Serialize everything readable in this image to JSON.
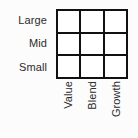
{
  "chart_data": {
    "type": "table",
    "title": "",
    "xlabel": "",
    "ylabel": "",
    "categories": [
      "Value",
      "Blend",
      "Growth"
    ],
    "rows": [
      "Large",
      "Mid",
      "Small"
    ],
    "values": [
      [
        "",
        "",
        ""
      ],
      [
        "",
        "",
        ""
      ],
      [
        "",
        "",
        ""
      ]
    ],
    "grid": true,
    "legend": "none"
  },
  "style_box": {
    "row_labels": [
      {
        "label": "Large"
      },
      {
        "label": "Mid"
      },
      {
        "label": "Small"
      }
    ],
    "column_labels": [
      {
        "label": "Value"
      },
      {
        "label": "Blend"
      },
      {
        "label": "Growth"
      }
    ],
    "cells": [
      {
        "row": "Large",
        "column": "Value",
        "value": ""
      },
      {
        "row": "Large",
        "column": "Blend",
        "value": ""
      },
      {
        "row": "Large",
        "column": "Growth",
        "value": ""
      },
      {
        "row": "Mid",
        "column": "Value",
        "value": ""
      },
      {
        "row": "Mid",
        "column": "Blend",
        "value": ""
      },
      {
        "row": "Mid",
        "column": "Growth",
        "value": ""
      },
      {
        "row": "Small",
        "column": "Value",
        "value": ""
      },
      {
        "row": "Small",
        "column": "Blend",
        "value": ""
      },
      {
        "row": "Small",
        "column": "Growth",
        "value": ""
      }
    ],
    "colors": {
      "background": "#fcfcfc",
      "grid_line": "#111111",
      "cell_fill": "#ffffff",
      "text": "#2b2b2b"
    }
  }
}
